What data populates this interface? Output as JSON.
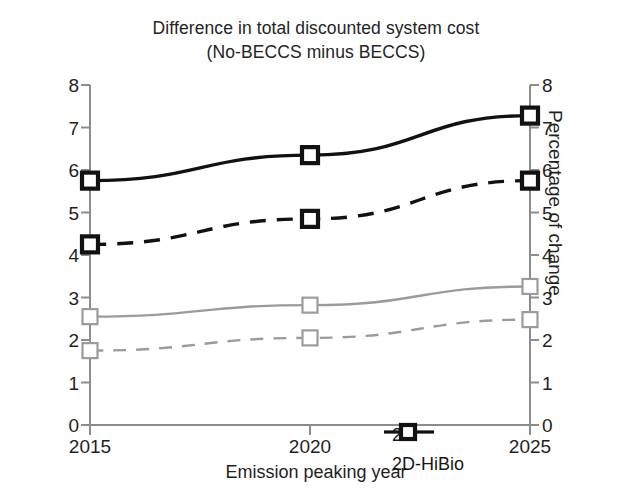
{
  "chart_data": {
    "type": "line",
    "title": "Difference in total discounted system cost (No-BECCS minus BECCS)",
    "title_line1": "Difference in total discounted system cost",
    "title_line2": "(No-BECCS minus BECCS)",
    "xlabel": "Emission peaking year",
    "ylabel": "Trillion $",
    "ylabel_right": "Percentage of change",
    "categories": [
      "2015",
      "2020",
      "2025"
    ],
    "x": [
      2015,
      2020,
      2025
    ],
    "xlim": [
      2015,
      2025
    ],
    "ylim": [
      0,
      8
    ],
    "ylim_right": [
      0,
      8
    ],
    "yticks": [
      "0",
      "1",
      "2",
      "3",
      "4",
      "5",
      "6",
      "7",
      "8"
    ],
    "yticks_right": [
      "0",
      "1",
      "2",
      "3",
      "4",
      "5",
      "6",
      "7",
      "8"
    ],
    "xticks": [
      "2015",
      "2020",
      "2025"
    ],
    "grid": false,
    "legend_position": "lower-right",
    "legend": [
      "2D",
      "2D-HiBio"
    ],
    "series": [
      {
        "name": "2D-HiBio cost",
        "legend": "2D-HiBio",
        "axis": "left",
        "unit": "Trillion $",
        "style": "solid",
        "color": "#111111",
        "values": [
          5.75,
          6.35,
          7.28
        ]
      },
      {
        "name": "2D-HiBio percentage of change",
        "legend": "2D-HiBio",
        "axis": "right",
        "unit": "Percentage of change",
        "style": "dashed",
        "color": "#111111",
        "values": [
          4.25,
          4.85,
          5.75
        ]
      },
      {
        "name": "2D cost",
        "legend": "2D",
        "axis": "left",
        "unit": "Trillion $",
        "style": "solid",
        "color": "#9b9b9b",
        "values": [
          2.55,
          2.82,
          3.26
        ]
      },
      {
        "name": "2D percentage of change",
        "legend": "2D",
        "axis": "right",
        "unit": "Percentage of change",
        "style": "dashed",
        "color": "#9b9b9b",
        "values": [
          1.75,
          2.05,
          2.48
        ]
      }
    ]
  },
  "legend": {
    "items": [
      {
        "label": "2D",
        "marker": "open-square",
        "weight": "thin"
      },
      {
        "label": "2D-HiBio",
        "marker": "open-square",
        "weight": "thick"
      }
    ]
  },
  "colors": {
    "black": "#111111",
    "gray": "#9b9b9b",
    "axis": "#8c8c8c",
    "text": "#1f1f1f"
  }
}
